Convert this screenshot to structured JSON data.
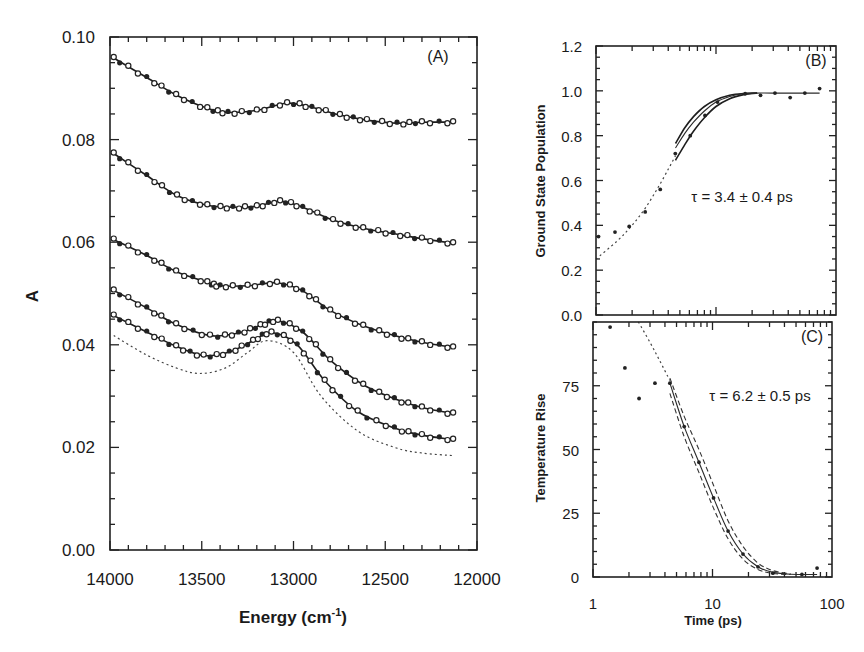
{
  "chart_data": [
    {
      "panel": "A",
      "type": "line",
      "panel_label": "(A)",
      "title": "",
      "xlabel": "Energy (cm",
      "xlabel_sup": "-1",
      "xlabel_close": ")",
      "ylabel": "A",
      "xlim": [
        14000,
        12000
      ],
      "ylim": [
        0.0,
        0.1
      ],
      "x_ticks": [
        14000,
        13500,
        13000,
        12500,
        12000
      ],
      "x_tick_labels": [
        "14000",
        "13500",
        "13000",
        "12500",
        "12000"
      ],
      "y_ticks": [
        0.0,
        0.02,
        0.04,
        0.06,
        0.08,
        0.1
      ],
      "y_tick_labels": [
        "0.00",
        "0.02",
        "0.04",
        "0.06",
        "0.08",
        "0.10"
      ],
      "x_minor_step": 100,
      "y_minor_step": 0.005,
      "grid": false,
      "series": [
        {
          "name": "spectrum 1",
          "style": "fit+open-markers",
          "x": [
            13980,
            13800,
            13640,
            13470,
            13357,
            13200,
            13035,
            12900,
            12747,
            12600,
            12436,
            12300,
            12130
          ],
          "y": [
            0.0959,
            0.0921,
            0.0887,
            0.0861,
            0.0853,
            0.0857,
            0.0871,
            0.0863,
            0.0848,
            0.0838,
            0.0832,
            0.0834,
            0.0834
          ]
        },
        {
          "name": "spectrum 2",
          "style": "fit+open-markers",
          "x": [
            13980,
            13800,
            13635,
            13470,
            13330,
            13200,
            13073,
            12950,
            12785,
            12620,
            12458,
            12300,
            12130
          ],
          "y": [
            0.0773,
            0.073,
            0.0691,
            0.0672,
            0.0668,
            0.067,
            0.068,
            0.0668,
            0.0643,
            0.0627,
            0.0617,
            0.0607,
            0.0598
          ]
        },
        {
          "name": "spectrum 3",
          "style": "fit+open-markers",
          "x": [
            13980,
            13800,
            13640,
            13470,
            13400,
            13250,
            13090,
            12950,
            12800,
            12620,
            12450,
            12300,
            12130
          ],
          "y": [
            0.0605,
            0.0574,
            0.0543,
            0.0522,
            0.0515,
            0.0515,
            0.0521,
            0.0505,
            0.0467,
            0.0437,
            0.0418,
            0.0405,
            0.0395
          ]
        },
        {
          "name": "spectrum 4",
          "style": "fit+open-markers",
          "x": [
            13980,
            13800,
            13640,
            13455,
            13300,
            13180,
            13085,
            12950,
            12800,
            12620,
            12450,
            12300,
            12130
          ],
          "y": [
            0.0506,
            0.0472,
            0.044,
            0.0418,
            0.0423,
            0.0438,
            0.0447,
            0.0425,
            0.037,
            0.0322,
            0.0295,
            0.0278,
            0.0266
          ]
        },
        {
          "name": "spectrum 5",
          "style": "fit+open-markers",
          "x": [
            13980,
            13800,
            13640,
            13490,
            13350,
            13220,
            13120,
            12980,
            12830,
            12650,
            12450,
            12300,
            12130
          ],
          "y": [
            0.0457,
            0.0425,
            0.0397,
            0.0379,
            0.0386,
            0.0408,
            0.0424,
            0.04,
            0.033,
            0.027,
            0.0238,
            0.0224,
            0.0215
          ]
        },
        {
          "name": "reference",
          "style": "dotted",
          "x": [
            13980,
            13800,
            13640,
            13510,
            13370,
            13250,
            13145,
            13000,
            12850,
            12650,
            12450,
            12300,
            12130
          ],
          "y": [
            0.0418,
            0.038,
            0.0355,
            0.0344,
            0.0355,
            0.0385,
            0.0408,
            0.0385,
            0.03,
            0.0232,
            0.02,
            0.0189,
            0.0184
          ]
        }
      ]
    },
    {
      "panel": "B",
      "type": "scatter",
      "panel_label": "(B)",
      "xlabel": "",
      "ylabel": "Ground State Population",
      "x_scale": "log",
      "xlim": [
        1,
        100
      ],
      "ylim": [
        0.0,
        1.2
      ],
      "y_ticks": [
        0.0,
        0.2,
        0.4,
        0.6,
        0.8,
        1.0,
        1.2
      ],
      "y_tick_labels": [
        "0.0",
        "0.2",
        "0.4",
        "0.6",
        "0.8",
        "1.0",
        "1.2"
      ],
      "y_minor_step": 0.05,
      "annotation": "τ = 3.4 ± 0.4 ps",
      "points": {
        "x": [
          1.05,
          1.44,
          1.89,
          2.57,
          3.43,
          4.58,
          6.1,
          8.1,
          10.3,
          17.5,
          23.5,
          31.0,
          41.5,
          55.0,
          73.0
        ],
        "y": [
          0.35,
          0.37,
          0.395,
          0.46,
          0.56,
          0.72,
          0.8,
          0.89,
          0.95,
          0.987,
          0.98,
          0.99,
          0.97,
          0.99,
          1.01
        ]
      },
      "fit": {
        "x": [
          4.6,
          5.5,
          6.5,
          8.0,
          10.0,
          13.0,
          17.0,
          22.0,
          30.0,
          73.0
        ],
        "y": [
          0.745,
          0.81,
          0.86,
          0.91,
          0.95,
          0.975,
          0.988,
          0.99,
          0.99,
          0.99
        ]
      },
      "fit_upper": {
        "x": [
          4.6,
          5.5,
          6.5,
          8.0,
          10.0,
          13.0,
          17.0,
          22.0
        ],
        "y": [
          0.765,
          0.835,
          0.885,
          0.93,
          0.96,
          0.98,
          0.988,
          0.99
        ]
      },
      "fit_lower": {
        "x": [
          4.6,
          5.5,
          6.5,
          8.0,
          10.0,
          13.0,
          17.0,
          22.0
        ],
        "y": [
          0.69,
          0.76,
          0.82,
          0.88,
          0.93,
          0.965,
          0.983,
          0.99
        ]
      },
      "extrapolation": {
        "x": [
          1.0,
          1.5,
          2.0,
          2.6,
          3.3,
          4.0,
          4.6
        ],
        "y": [
          0.25,
          0.33,
          0.4,
          0.48,
          0.57,
          0.65,
          0.71
        ]
      }
    },
    {
      "panel": "C",
      "type": "scatter",
      "panel_label": "(C)",
      "xlabel": "Time (ps)",
      "ylabel": "Temperature Rise",
      "x_scale": "log",
      "xlim": [
        1,
        100
      ],
      "ylim": [
        0,
        100
      ],
      "x_ticks": [
        1,
        10,
        100
      ],
      "x_tick_labels": [
        "1",
        "10",
        "100"
      ],
      "y_ticks": [
        0,
        25,
        50,
        75
      ],
      "y_tick_labels": [
        "0",
        "25",
        "50",
        "75"
      ],
      "y_minor_step": 5,
      "annotation": "τ = 6.2 ± 0.5 ps",
      "points": {
        "x": [
          1.39,
          1.85,
          2.43,
          3.3,
          4.4,
          5.8,
          7.7,
          10.2,
          13.5,
          18.0,
          24.0,
          32.0,
          56.0,
          75.0
        ],
        "y": [
          98,
          82,
          70,
          76,
          76,
          59,
          45,
          31,
          18,
          9,
          4,
          1.5,
          1,
          3.5
        ]
      },
      "fit": {
        "x": [
          4.4,
          5.8,
          7.7,
          10.2,
          13.5,
          18.0,
          24.0,
          32.0,
          45.0,
          75.0
        ],
        "y": [
          76,
          59,
          45,
          31,
          18,
          9,
          4,
          1.8,
          1.1,
          1.0
        ]
      },
      "fit_upper": {
        "x": [
          4.4,
          5.8,
          7.7,
          10.2,
          13.5,
          18.0,
          24.0,
          32.0,
          45.0
        ],
        "y": [
          78,
          63,
          50,
          36,
          22,
          12,
          5.5,
          2.5,
          1.2
        ]
      },
      "fit_lower": {
        "x": [
          4.4,
          5.8,
          7.7,
          10.2,
          13.5,
          18.0,
          24.0,
          32.0,
          45.0
        ],
        "y": [
          72,
          55,
          41,
          27,
          15,
          7,
          3,
          1.4,
          1.0
        ]
      },
      "extrapolation": {
        "x": [
          2.4,
          3.0,
          3.6,
          4.4
        ],
        "y": [
          100,
          92,
          85,
          77
        ]
      }
    }
  ]
}
